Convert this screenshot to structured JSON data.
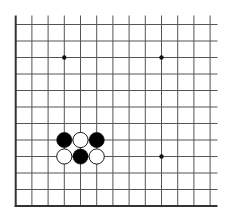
{
  "board": {
    "columns_visible": 13,
    "rows_visible": 12,
    "grid_origin": {
      "x": 15.7,
      "y": 24.5
    },
    "cell_width": 16.2,
    "cell_height": 16.5,
    "top_open_y": 15.5,
    "right_open_x": 217.5,
    "edges": {
      "left": true,
      "bottom": true,
      "top": false,
      "right": false
    },
    "colors": {
      "background": "#ffffff",
      "line": "#555555",
      "edge": "#333333",
      "black_stone": "#000000",
      "white_stone": "#ffffff",
      "stone_outline": "#000000",
      "star_point": "#111111"
    },
    "star_points": [
      {
        "col": 3,
        "row": 2
      },
      {
        "col": 9,
        "row": 2
      },
      {
        "col": 9,
        "row": 8
      }
    ],
    "stones": [
      {
        "col": 3,
        "row": 7,
        "color": "black"
      },
      {
        "col": 4,
        "row": 7,
        "color": "white"
      },
      {
        "col": 5,
        "row": 7,
        "color": "black"
      },
      {
        "col": 3,
        "row": 8,
        "color": "white"
      },
      {
        "col": 4,
        "row": 8,
        "color": "black"
      },
      {
        "col": 5,
        "row": 8,
        "color": "white"
      }
    ]
  }
}
